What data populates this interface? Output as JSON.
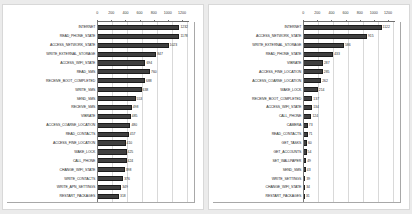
{
  "background_color": "#ebebeb",
  "panel_color": "#ffffff",
  "bar_color": "#3f3f3f",
  "charts": [
    {
      "name": "malware-permissions-chart",
      "type": "bar",
      "orientation": "horizontal",
      "title": "",
      "subtitle": "",
      "xlabel": "",
      "ylabel": "",
      "xlim": [
        0,
        1300
      ],
      "ticks": [
        0,
        200,
        400,
        600,
        800,
        1000,
        1200
      ],
      "tick_labels": [
        "0",
        "200",
        "400",
        "600",
        "800",
        "1000",
        "1200"
      ],
      "grid": true,
      "legend": "none",
      "categories": [
        "INTERNET",
        "READ_PHONE_STATE",
        "ACCESS_NETWORK_STATE",
        "WRITE_EXTERNAL_STORAGE",
        "ACCESS_WIFI_STATE",
        "READ_SMS",
        "RECEIVE_BOOT_COMPLETED",
        "WRITE_SMS",
        "SEND_SMS",
        "RECEIVE_SMS",
        "VIBRATE",
        "ACCESS_COARSE_LOCATION",
        "READ_CONTACTS",
        "ACCESS_FINE_LOCATION",
        "WAKE_LOCK",
        "CALL_PHONE",
        "CHANGE_WIFI_STATE",
        "WRITE_CONTACTS",
        "WRITE_APN_SETTINGS",
        "RESTART_PACKAGES"
      ],
      "values": [
        1232,
        1178,
        1023,
        847,
        694,
        760,
        688,
        638,
        553,
        498,
        485,
        480,
        457,
        410,
        425,
        424,
        398,
        376,
        349,
        318
      ]
    },
    {
      "name": "benign-permissions-chart",
      "type": "bar",
      "orientation": "horizontal",
      "title": "",
      "subtitle": "",
      "xlabel": "",
      "ylabel": "",
      "xlim": [
        0,
        1300
      ],
      "ticks": [
        0,
        200,
        400,
        600,
        800,
        1000,
        1200
      ],
      "tick_labels": [
        "0",
        "200",
        "400",
        "600",
        "800",
        "1000",
        "1200"
      ],
      "grid": true,
      "legend": "none",
      "categories": [
        "INTERNET",
        "ACCESS_NETWORK_STATE",
        "WRITE_EXTERNAL_STORAGE",
        "READ_PHONE_STATE",
        "VIBRATE",
        "ACCESS_FINE_LOCATION",
        "ACCESS_COARSE_LOCATION",
        "WAKE_LOCK",
        "RECEIVE_BOOT_COMPLETED",
        "ACCESS_WIFI_STATE",
        "CALL_PHONE",
        "CAMERA",
        "READ_CONTACTS",
        "GET_TASKS",
        "GET_ACCOUNTS",
        "SET_WALLPAPER",
        "SEND_SMS",
        "WRITE_SETTINGS",
        "CHANGE_WIFI_STATE",
        "RESTART_PACKAGES"
      ],
      "values": [
        1122,
        915,
        586,
        433,
        287,
        285,
        262,
        214,
        137,
        134,
        124,
        73,
        71,
        60,
        54,
        49,
        43,
        39,
        34,
        31
      ]
    }
  ],
  "chart_data": [
    {
      "type": "bar",
      "title": "Permission frequency (set 1)",
      "xlabel": "",
      "ylabel": "",
      "xlim": [
        0,
        1300
      ],
      "grid": true,
      "legend_position": "none",
      "categories": [
        "INTERNET",
        "READ_PHONE_STATE",
        "ACCESS_NETWORK_STATE",
        "WRITE_EXTERNAL_STORAGE",
        "ACCESS_WIFI_STATE",
        "READ_SMS",
        "RECEIVE_BOOT_COMPLETED",
        "WRITE_SMS",
        "SEND_SMS",
        "RECEIVE_SMS",
        "VIBRATE",
        "ACCESS_COARSE_LOCATION",
        "READ_CONTACTS",
        "ACCESS_FINE_LOCATION",
        "WAKE_LOCK",
        "CALL_PHONE",
        "CHANGE_WIFI_STATE",
        "WRITE_CONTACTS",
        "WRITE_APN_SETTINGS",
        "RESTART_PACKAGES"
      ],
      "values": [
        1232,
        1178,
        1023,
        847,
        694,
        760,
        688,
        638,
        553,
        498,
        485,
        480,
        457,
        410,
        425,
        424,
        398,
        376,
        349,
        318
      ]
    },
    {
      "type": "bar",
      "title": "Permission frequency (set 2)",
      "xlabel": "",
      "ylabel": "",
      "xlim": [
        0,
        1300
      ],
      "grid": true,
      "legend_position": "none",
      "categories": [
        "INTERNET",
        "ACCESS_NETWORK_STATE",
        "WRITE_EXTERNAL_STORAGE",
        "READ_PHONE_STATE",
        "VIBRATE",
        "ACCESS_FINE_LOCATION",
        "ACCESS_COARSE_LOCATION",
        "WAKE_LOCK",
        "RECEIVE_BOOT_COMPLETED",
        "ACCESS_WIFI_STATE",
        "CALL_PHONE",
        "CAMERA",
        "READ_CONTACTS",
        "GET_TASKS",
        "GET_ACCOUNTS",
        "SET_WALLPAPER",
        "SEND_SMS",
        "WRITE_SETTINGS",
        "CHANGE_WIFI_STATE",
        "RESTART_PACKAGES"
      ],
      "values": [
        1122,
        915,
        586,
        433,
        287,
        285,
        262,
        214,
        137,
        134,
        124,
        73,
        71,
        60,
        54,
        49,
        43,
        39,
        34,
        31
      ]
    }
  ]
}
